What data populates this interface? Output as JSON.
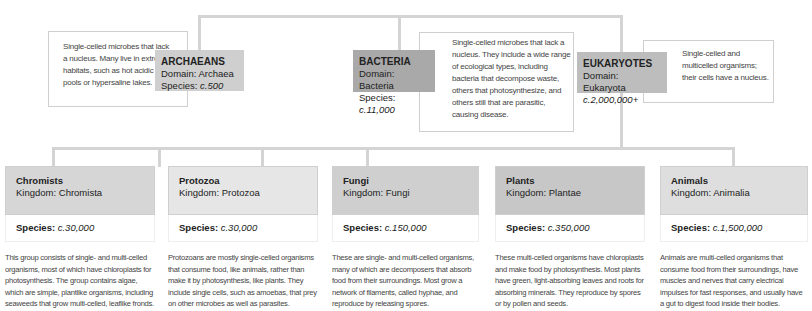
{
  "domains": [
    {
      "name": "ARCHAEANS",
      "domain_label": "Domain: Archaea",
      "species_label": "Species:",
      "species_value": "c.500",
      "description": "Single-celled microbes that lack a nucleus. Many live in extreme habitats, such as hot acidic pools or hypersaline lakes.",
      "color": "#cfcfcf"
    },
    {
      "name": "BACTERIA",
      "domain_label": "Domain: Bacteria",
      "species_label": "Species:",
      "species_value": "c.11,000",
      "description": "Single-celled microbes that lack a nucleus. They include a wide range of ecological types, including bacteria that decompose waste, others that photosynthesize, and others still that are parasitic, causing disease.",
      "color": "#a9a9a9"
    },
    {
      "name": "EUKARYOTES",
      "domain_label": "Domain: Eukaryota",
      "species_value": "c.2,000,000+",
      "description": "Single-celled and multicelled organisms; their cells have a nucleus.",
      "color": "#bdbdbd"
    }
  ],
  "kingdoms": [
    {
      "name": "Chromists",
      "kingdom_label": "Kingdom: Chromista",
      "species_label": "Species:",
      "species_value": "c.30,000",
      "description": "This group consists of single- and multi-celled organisms, most of which have chloroplasts for photosynthesis. The group contains algae, which are simple, plantlike organisms, including seaweeds that grow multi-celled, leaflike fronds."
    },
    {
      "name": "Protozoa",
      "kingdom_label": "Kingdom: Protozoa",
      "species_label": "Species:",
      "species_value": "c.30,000",
      "description": "Protozoans are mostly single-celled organisms that consume food, like animals, rather than make it by photosynthesis, like plants. They include single cells, such as amoebas, that prey on other microbes as well as parasites."
    },
    {
      "name": "Fungi",
      "kingdom_label": "Kingdom: Fungi",
      "species_label": "Species:",
      "species_value": "c.150,000",
      "description": "These are single- and multi-celled organisms, many of which are decomposers that absorb food from their surroundings. Most grow a network of filaments, called hyphae, and reproduce by releasing spores."
    },
    {
      "name": "Plants",
      "kingdom_label": "Kingdom: Plantae",
      "species_label": "Species:",
      "species_value": "c.350,000",
      "description": "These multi-celled organisms have chloroplasts and make food by photosynthesis. Most plants have green, light-absorbing leaves and roots for absorbing minerals. They reproduce by spores or by pollen and seeds."
    },
    {
      "name": "Animals",
      "kingdom_label": "Kingdom: Animalia",
      "species_label": "Species:",
      "species_value": "c.1,500,000",
      "description": "Animals are multi-celled organisms that consume food from their surroundings, have muscles and nerves that carry electrical impulses for fast responses, and usually have a gut to digest food inside their bodies."
    }
  ]
}
